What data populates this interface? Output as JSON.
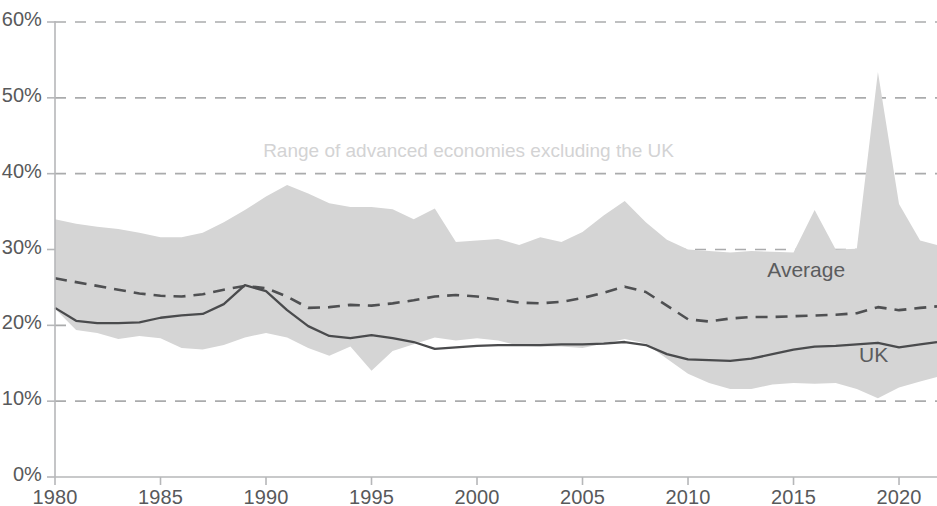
{
  "chart_data": {
    "type": "area",
    "title": "",
    "subtitle": "",
    "xlabel": "",
    "ylabel": "",
    "xlim": [
      1980,
      2021.8
    ],
    "ylim": [
      0,
      60
    ],
    "grid": "horizontal-dashed",
    "legend_position": "inline-annotations",
    "y_tick_labels": [
      "0%",
      "10%",
      "20%",
      "30%",
      "40%",
      "50%",
      "60%"
    ],
    "y_tick_values": [
      0,
      10,
      20,
      30,
      40,
      50,
      60
    ],
    "x_tick_labels": [
      "1980",
      "1985",
      "1990",
      "1995",
      "2000",
      "2005",
      "2010",
      "2015",
      "2020"
    ],
    "x_tick_values": [
      1980,
      1985,
      1990,
      1995,
      2000,
      2005,
      2010,
      2015,
      2020
    ],
    "x": [
      1980,
      1981,
      1982,
      1983,
      1984,
      1985,
      1986,
      1987,
      1988,
      1989,
      1990,
      1991,
      1992,
      1993,
      1994,
      1995,
      1996,
      1997,
      1998,
      1999,
      2000,
      2001,
      2002,
      2003,
      2004,
      2005,
      2006,
      2007,
      2008,
      2009,
      2010,
      2011,
      2012,
      2013,
      2014,
      2015,
      2016,
      2017,
      2018,
      2019,
      2020,
      2021,
      2021.8
    ],
    "series": [
      {
        "name": "Range of advanced economies excluding the UK",
        "type": "band",
        "color": "#d5d5d5",
        "upper": [
          34.0,
          33.4,
          33.0,
          32.7,
          32.2,
          31.6,
          31.6,
          32.2,
          33.6,
          35.2,
          37.0,
          38.5,
          37.4,
          36.1,
          35.6,
          35.6,
          35.3,
          34.0,
          35.4,
          31.0,
          31.2,
          31.4,
          30.6,
          31.6,
          31.0,
          32.3,
          34.5,
          36.4,
          33.6,
          31.3,
          30.0,
          29.8,
          29.6,
          29.8,
          29.7,
          29.6,
          35.2,
          30.0,
          30.1,
          53.4,
          36.0,
          31.2,
          30.6
        ],
        "lower": [
          22.2,
          19.4,
          19.0,
          18.2,
          18.6,
          18.3,
          17.0,
          16.8,
          17.4,
          18.4,
          19.0,
          18.4,
          17.0,
          16.0,
          17.2,
          14.0,
          16.6,
          17.5,
          18.4,
          18.0,
          18.3,
          18.0,
          17.3,
          17.2,
          17.2,
          17.0,
          17.6,
          18.2,
          17.6,
          15.6,
          13.6,
          12.4,
          11.6,
          11.6,
          12.2,
          12.4,
          12.3,
          12.4,
          11.6,
          10.4,
          11.8,
          12.6,
          13.2
        ]
      },
      {
        "name": "Average",
        "type": "line-dashed",
        "color": "#4f5052",
        "values": [
          26.2,
          25.7,
          25.2,
          24.7,
          24.2,
          23.9,
          23.8,
          24.1,
          24.7,
          25.2,
          24.9,
          23.8,
          22.3,
          22.4,
          22.7,
          22.6,
          22.9,
          23.3,
          23.8,
          24.0,
          23.8,
          23.4,
          23.0,
          22.9,
          23.1,
          23.6,
          24.3,
          25.1,
          24.4,
          22.6,
          20.8,
          20.5,
          20.9,
          21.1,
          21.1,
          21.2,
          21.3,
          21.4,
          21.6,
          22.4,
          22.0,
          22.3,
          22.5
        ]
      },
      {
        "name": "UK",
        "type": "line-solid",
        "color": "#4a4b4d",
        "values": [
          22.3,
          20.6,
          20.3,
          20.3,
          20.4,
          21.0,
          21.3,
          21.5,
          22.8,
          25.3,
          24.5,
          22.0,
          19.9,
          18.6,
          18.3,
          18.7,
          18.3,
          17.8,
          16.9,
          17.1,
          17.3,
          17.4,
          17.4,
          17.4,
          17.5,
          17.5,
          17.6,
          17.8,
          17.4,
          16.2,
          15.5,
          15.4,
          15.3,
          15.6,
          16.2,
          16.8,
          17.2,
          17.3,
          17.5,
          17.7,
          17.1,
          17.5,
          17.8
        ]
      }
    ],
    "annotations": [
      {
        "id": "range-label",
        "text": "Range of advanced economies excluding the UK",
        "x": 1999.6,
        "y": 42.8,
        "color": "#d3d3d4"
      },
      {
        "id": "average-label",
        "text": "Average",
        "x": 2015.6,
        "y": 27.3,
        "color": "#5b5c5e"
      },
      {
        "id": "uk-label",
        "text": "UK",
        "x": 2018.8,
        "y": 16.1,
        "color": "#5b5c5e"
      }
    ],
    "colors": {
      "band_fill": "#d5d5d5",
      "average_line": "#4f5052",
      "uk_line": "#4a4b4d",
      "gridline": "#9b9c9e",
      "axis": "#b6b7b9",
      "tick_text": "#58595b",
      "background": "#ffffff"
    }
  }
}
